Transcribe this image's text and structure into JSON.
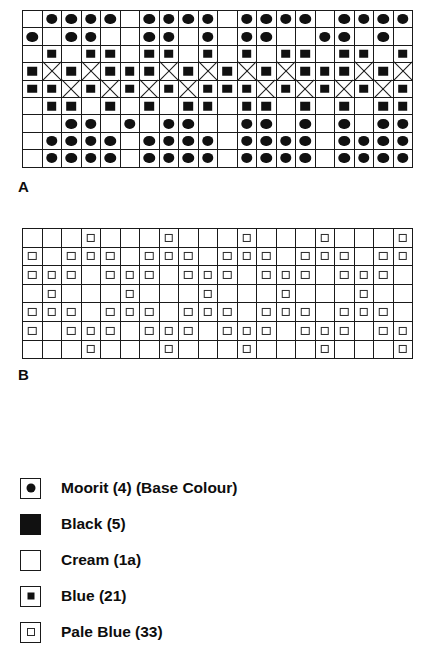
{
  "charts": [
    {
      "id": "chart-a",
      "label": "A",
      "columns": 20,
      "rows": 9,
      "label_x": 18,
      "label_y": 178,
      "grid_x": 22,
      "grid_y": 10,
      "cell_w": 19.5,
      "cell_h": 17.4,
      "legend_note": "symbol codes: 0=blank(Cream), 1=circle(Moorit), 2=filled square(Blue/Black), 3=diagonal cross(X)",
      "matrix": [
        [
          0,
          1,
          1,
          1,
          1,
          0,
          1,
          1,
          1,
          1,
          0,
          1,
          1,
          1,
          1,
          0,
          1,
          1,
          1,
          1
        ],
        [
          1,
          0,
          1,
          1,
          0,
          0,
          1,
          1,
          0,
          1,
          0,
          1,
          1,
          0,
          0,
          1,
          1,
          0,
          1,
          0
        ],
        [
          0,
          2,
          0,
          2,
          2,
          0,
          2,
          2,
          0,
          2,
          0,
          2,
          0,
          2,
          2,
          0,
          2,
          2,
          0,
          2
        ],
        [
          2,
          3,
          2,
          3,
          2,
          2,
          2,
          3,
          2,
          3,
          2,
          3,
          2,
          3,
          2,
          2,
          2,
          3,
          2,
          3
        ],
        [
          2,
          2,
          3,
          2,
          3,
          2,
          3,
          2,
          3,
          2,
          2,
          2,
          3,
          2,
          3,
          2,
          3,
          2,
          3,
          2
        ],
        [
          0,
          2,
          2,
          0,
          2,
          0,
          2,
          0,
          2,
          2,
          0,
          2,
          2,
          0,
          2,
          0,
          2,
          0,
          2,
          2
        ],
        [
          0,
          0,
          1,
          1,
          0,
          1,
          0,
          1,
          1,
          0,
          0,
          1,
          1,
          0,
          1,
          0,
          1,
          0,
          1,
          1
        ],
        [
          0,
          1,
          1,
          1,
          1,
          0,
          1,
          1,
          1,
          1,
          0,
          1,
          1,
          1,
          1,
          0,
          1,
          1,
          1,
          1
        ],
        [
          0,
          1,
          1,
          1,
          1,
          0,
          1,
          1,
          1,
          1,
          0,
          1,
          1,
          1,
          1,
          0,
          1,
          1,
          1,
          1
        ]
      ]
    },
    {
      "id": "chart-b",
      "label": "B",
      "columns": 20,
      "rows": 7,
      "label_x": 18,
      "label_y": 366,
      "grid_x": 22,
      "grid_y": 228,
      "cell_w": 19.5,
      "cell_h": 18.6,
      "legend_note": "symbol codes: 0=blank(Cream), 4=small open square(Pale Blue)",
      "matrix": [
        [
          0,
          0,
          0,
          4,
          0,
          0,
          0,
          4,
          0,
          0,
          0,
          4,
          0,
          0,
          0,
          4,
          0,
          0,
          0,
          4
        ],
        [
          4,
          0,
          4,
          4,
          4,
          0,
          4,
          4,
          4,
          0,
          4,
          4,
          4,
          0,
          4,
          4,
          4,
          0,
          4,
          4
        ],
        [
          4,
          4,
          4,
          0,
          4,
          4,
          4,
          0,
          4,
          4,
          4,
          0,
          4,
          4,
          4,
          0,
          4,
          4,
          4,
          0
        ],
        [
          0,
          4,
          0,
          0,
          0,
          4,
          0,
          0,
          0,
          4,
          0,
          0,
          0,
          4,
          0,
          0,
          0,
          4,
          0,
          0
        ],
        [
          4,
          4,
          4,
          0,
          4,
          4,
          4,
          0,
          4,
          4,
          4,
          0,
          4,
          4,
          4,
          0,
          4,
          4,
          4,
          0
        ],
        [
          4,
          0,
          4,
          4,
          4,
          0,
          4,
          4,
          4,
          0,
          4,
          4,
          4,
          0,
          4,
          4,
          4,
          0,
          4,
          4
        ],
        [
          0,
          0,
          0,
          4,
          0,
          0,
          0,
          4,
          0,
          0,
          0,
          4,
          0,
          0,
          0,
          4,
          0,
          0,
          0,
          4
        ]
      ]
    }
  ],
  "legend": {
    "items": [
      {
        "symbol": "filled-circle-in-box",
        "label": "Moorit (4) (Base Colour)"
      },
      {
        "symbol": "solid-black-box",
        "label": "Black (5)"
      },
      {
        "symbol": "empty-box",
        "label": "Cream (1a)"
      },
      {
        "symbol": "small-filled-square-in-box",
        "label": "Blue (21)"
      },
      {
        "symbol": "small-open-square-in-box",
        "label": "Pale Blue (33)"
      }
    ]
  },
  "colors": {
    "ink": "#111111",
    "rule": "#1a1a1a",
    "paper": "#ffffff"
  }
}
